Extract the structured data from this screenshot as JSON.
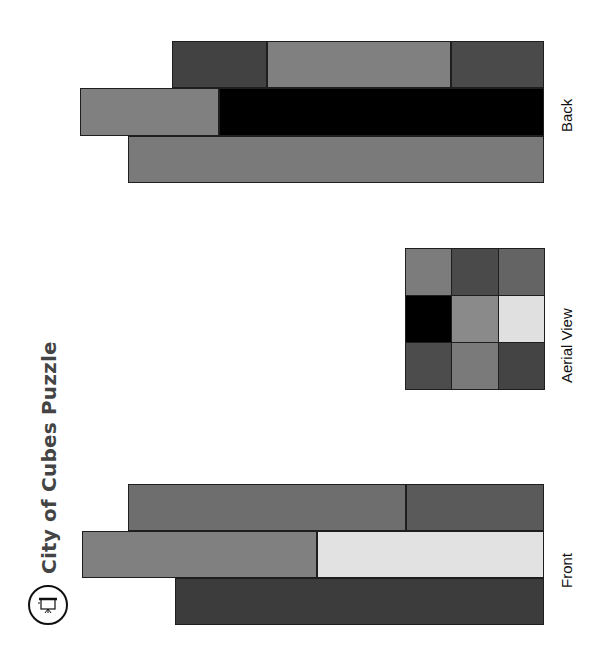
{
  "title": "City of Cubes Puzzle",
  "icon": "puzzle-logo-icon",
  "views": {
    "front": {
      "label": "Front",
      "blocks": [
        {
          "x": 128,
          "y": 484,
          "w": 278,
          "h": 47,
          "color": "#6e6e6e"
        },
        {
          "x": 406,
          "y": 484,
          "w": 138,
          "h": 47,
          "color": "#5a5a5a"
        },
        {
          "x": 82,
          "y": 531,
          "w": 235,
          "h": 47,
          "color": "#808080"
        },
        {
          "x": 317,
          "y": 531,
          "w": 227,
          "h": 47,
          "color": "#e2e2e2"
        },
        {
          "x": 175,
          "y": 578,
          "w": 369,
          "h": 47,
          "color": "#3c3c3c"
        }
      ]
    },
    "aerial": {
      "label": "Aerial View",
      "grid": [
        [
          "#7c7c7c",
          "#4a4a4a",
          "#646464"
        ],
        [
          "#000000",
          "#8a8a8a",
          "#e0e0e0"
        ],
        [
          "#4c4c4c",
          "#7a7a7a",
          "#444444"
        ]
      ]
    },
    "back": {
      "label": "Back",
      "blocks": [
        {
          "x": 172,
          "y": 41,
          "w": 95,
          "h": 47,
          "color": "#424242"
        },
        {
          "x": 267,
          "y": 41,
          "w": 184,
          "h": 47,
          "color": "#808080"
        },
        {
          "x": 451,
          "y": 41,
          "w": 93,
          "h": 47,
          "color": "#4a4a4a"
        },
        {
          "x": 80,
          "y": 88,
          "w": 139,
          "h": 48,
          "color": "#808080"
        },
        {
          "x": 219,
          "y": 88,
          "w": 325,
          "h": 48,
          "color": "#000000"
        },
        {
          "x": 128,
          "y": 136,
          "w": 416,
          "h": 47,
          "color": "#7a7a7a"
        }
      ]
    }
  }
}
